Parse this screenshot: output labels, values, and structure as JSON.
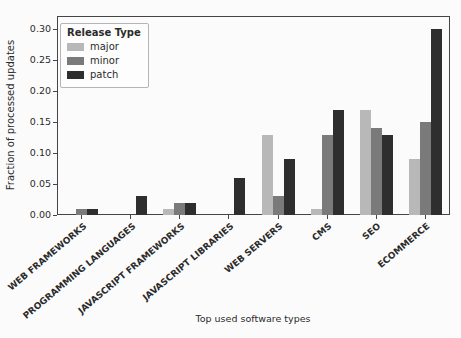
{
  "figure": {
    "background": "#fbfbfb",
    "axis_color": "#454545",
    "text_color": "#2b2b2b"
  },
  "chart_data": {
    "type": "bar",
    "title": "",
    "xlabel": "Top used software types",
    "ylabel": "Fraction of processed updates",
    "categories": [
      "WEB FRAMEWORKS",
      "PROGRAMMING LANGUAGES",
      "JAVASCRIPT FRAMEWORKS",
      "JAVASCRIPT LIBRARIES",
      "WEB SERVERS",
      "CMS",
      "SEO",
      "ECOMMERCE"
    ],
    "series": [
      {
        "name": "major",
        "color": "#b8b8b8",
        "values": [
          0,
          0,
          0.01,
          0,
          0.13,
          0.01,
          0.17,
          0.09
        ]
      },
      {
        "name": "minor",
        "color": "#7a7a7a",
        "values": [
          0.01,
          0,
          0.02,
          0,
          0.03,
          0.13,
          0.14,
          0.15
        ]
      },
      {
        "name": "patch",
        "color": "#2e2e2e",
        "values": [
          0.01,
          0.03,
          0.02,
          0.06,
          0.09,
          0.17,
          0.13,
          0.3
        ]
      }
    ],
    "legend": {
      "title": "Release Type",
      "position": "upper left"
    },
    "y_ticks": [
      0,
      0.05,
      0.1,
      0.15,
      0.2,
      0.25,
      0.3
    ],
    "y_tick_labels": [
      "0.00",
      "0.05",
      "0.10",
      "0.15",
      "0.20",
      "0.25",
      "0.30"
    ],
    "ylim": [
      0,
      0.3215
    ],
    "grid": false,
    "x_tick_rotation_deg": 40
  }
}
